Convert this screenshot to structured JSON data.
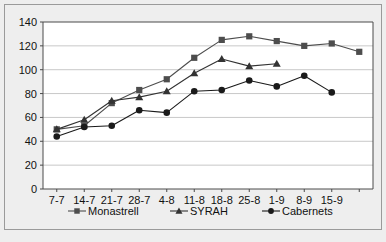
{
  "chart_data": {
    "type": "line",
    "title": "",
    "subtitle": "",
    "xlabel": "",
    "ylabel": "",
    "categories": [
      "7-7",
      "14-7",
      "21-7",
      "28-7",
      "4-8",
      "11-8",
      "18-8",
      "25-8",
      "1-9",
      "8-9",
      "15-9",
      ""
    ],
    "ylim": [
      0,
      140
    ],
    "ytick_step": 20,
    "yticks": [
      "0",
      "20",
      "40",
      "60",
      "80",
      "100",
      "120",
      "140"
    ],
    "grid": "horizontal",
    "legend_position": "bottom",
    "series": [
      {
        "name": "Monastrell",
        "marker": "square",
        "color": "#4d4d4d",
        "values": [
          50,
          53,
          72,
          83,
          92,
          110,
          125,
          128,
          124,
          120,
          122,
          115
        ]
      },
      {
        "name": "SYRAH",
        "marker": "triangle",
        "color": "#333333",
        "values": [
          50,
          58,
          74,
          77,
          82,
          97,
          109,
          103,
          105,
          null,
          null,
          null
        ]
      },
      {
        "name": "Cabernets",
        "marker": "circle",
        "color": "#1a1a1a",
        "values": [
          44,
          52,
          53,
          66,
          64,
          82,
          83,
          91,
          86,
          95,
          81,
          null
        ]
      }
    ]
  },
  "legend": {
    "items": [
      {
        "label": "Monastrell",
        "marker": "square"
      },
      {
        "label": "SYRAH",
        "marker": "triangle"
      },
      {
        "label": "Cabernets",
        "marker": "circle"
      }
    ]
  },
  "colors": {
    "background": "#eeeeee",
    "plot_background": "#ffffff",
    "gridline": "#c8c8c8",
    "axis": "#4a4a4a",
    "border": "#9a9a9a",
    "text": "#111111"
  }
}
